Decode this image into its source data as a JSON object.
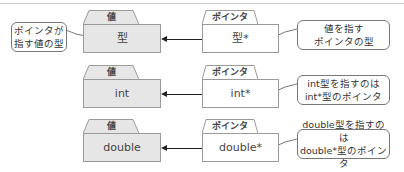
{
  "left_callout": {
    "line1": "ポインタが",
    "line2": "指す値の型"
  },
  "rows": [
    {
      "value_tab": "値",
      "value_type": "型",
      "pointer_tab": "ポインタ",
      "pointer_type": "型*",
      "callout_line1": "値を指す",
      "callout_line2": "ポインタの型"
    },
    {
      "value_tab": "値",
      "value_type": "int",
      "pointer_tab": "ポインタ",
      "pointer_type": "int*",
      "callout_line1": "int型を指すのは",
      "callout_line2": "int*型のポインタ"
    },
    {
      "value_tab": "値",
      "value_type": "double",
      "pointer_tab": "ポインタ",
      "pointer_type": "double*",
      "callout_line1": "double型を指すのは",
      "callout_line2": "double*型のポインタ"
    }
  ],
  "colors": {
    "value_fill": "#e6e6e6",
    "pointer_fill": "#ffffff",
    "border": "#9a9a9a",
    "arrow": "#222222"
  }
}
